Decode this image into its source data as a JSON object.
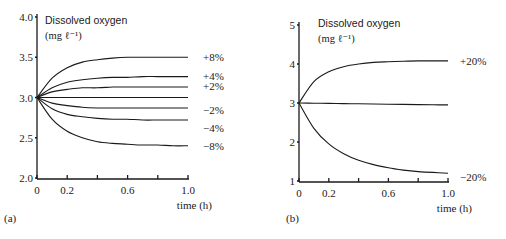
{
  "chart_data": [
    {
      "panel": "(a)",
      "type": "line",
      "ylabel": "Dissolved oxygen",
      "yunit": "(mg ℓ⁻¹)",
      "xlabel": "time (h)",
      "xlim": [
        0,
        1.0
      ],
      "ylim": [
        2.0,
        4.0
      ],
      "xticks": [
        0,
        0.2,
        0.4,
        0.6,
        0.8,
        1.0
      ],
      "xtick_labels": [
        "0",
        "0.2",
        "",
        "0.6",
        "",
        "1.0"
      ],
      "yticks": [
        2.0,
        2.5,
        3.0,
        3.5,
        4.0
      ],
      "ytick_labels": [
        "2.0",
        "2.5",
        "3.0",
        "3.5",
        "4.0"
      ],
      "grid": false,
      "x": [
        0,
        0.1,
        0.2,
        0.3,
        0.4,
        0.5,
        0.6,
        0.7,
        0.8,
        0.9,
        1.0
      ],
      "series": [
        {
          "name": "+8%",
          "values": [
            3.0,
            3.24,
            3.37,
            3.44,
            3.47,
            3.49,
            3.5,
            3.5,
            3.5,
            3.5,
            3.5
          ]
        },
        {
          "name": "+4%",
          "values": [
            3.0,
            3.12,
            3.19,
            3.22,
            3.24,
            3.25,
            3.25,
            3.26,
            3.26,
            3.26,
            3.26
          ]
        },
        {
          "name": "+2%",
          "values": [
            3.0,
            3.07,
            3.1,
            3.12,
            3.12,
            3.13,
            3.13,
            3.13,
            3.13,
            3.13,
            3.13
          ]
        },
        {
          "name": "0%",
          "values": [
            3.0,
            3.0,
            3.0,
            3.0,
            3.0,
            3.0,
            3.0,
            3.0,
            3.0,
            3.0,
            3.0
          ]
        },
        {
          "name": "-2%",
          "values": [
            3.0,
            2.93,
            2.9,
            2.88,
            2.87,
            2.87,
            2.87,
            2.87,
            2.87,
            2.87,
            2.87
          ]
        },
        {
          "name": "-4%",
          "values": [
            3.0,
            2.86,
            2.79,
            2.76,
            2.74,
            2.73,
            2.73,
            2.72,
            2.72,
            2.72,
            2.72
          ]
        },
        {
          "name": "-8%",
          "values": [
            3.0,
            2.73,
            2.58,
            2.5,
            2.45,
            2.43,
            2.42,
            2.41,
            2.41,
            2.4,
            2.4
          ]
        }
      ]
    },
    {
      "panel": "(b)",
      "type": "line",
      "ylabel": "Dissolved oxygen",
      "yunit": "(mg ℓ⁻¹)",
      "xlabel": "time (h)",
      "xlim": [
        0,
        1.0
      ],
      "ylim": [
        1,
        5
      ],
      "xticks": [
        0,
        0.2,
        0.4,
        0.6,
        0.8,
        1.0
      ],
      "xtick_labels": [
        "0",
        "0.2",
        "",
        "0.6",
        "",
        "1.0"
      ],
      "yticks": [
        1,
        2,
        3,
        4,
        5
      ],
      "ytick_labels": [
        "1",
        "2",
        "3",
        "4",
        "5"
      ],
      "grid": false,
      "x": [
        0,
        0.1,
        0.2,
        0.3,
        0.4,
        0.5,
        0.6,
        0.7,
        0.8,
        0.9,
        1.0
      ],
      "series": [
        {
          "name": "+20%",
          "values": [
            3.0,
            3.55,
            3.8,
            3.93,
            4.0,
            4.04,
            4.06,
            4.07,
            4.08,
            4.08,
            4.08
          ]
        },
        {
          "name": "0%",
          "values": [
            3.0,
            2.995,
            2.99,
            2.985,
            2.98,
            2.975,
            2.97,
            2.965,
            2.96,
            2.955,
            2.95
          ]
        },
        {
          "name": "-20%",
          "values": [
            3.0,
            2.35,
            1.95,
            1.7,
            1.53,
            1.42,
            1.34,
            1.28,
            1.24,
            1.22,
            1.2
          ]
        }
      ]
    }
  ]
}
